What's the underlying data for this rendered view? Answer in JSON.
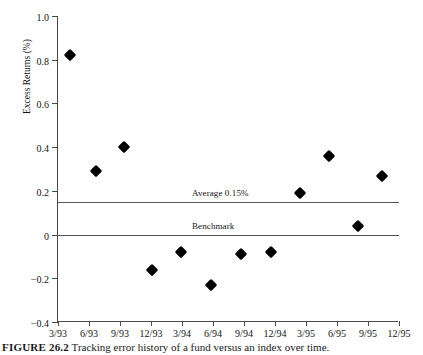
{
  "chart_data": {
    "type": "scatter",
    "title": "",
    "xlabel": "",
    "ylabel": "Excess Returns (%)",
    "ylim": [
      -0.4,
      1.0
    ],
    "yticks": [
      "1.0",
      "0.8",
      "0.6",
      "0.4",
      "0.2",
      "0",
      "-0.2",
      "-0.4"
    ],
    "ytick_values": [
      1.0,
      0.8,
      0.6,
      0.4,
      0.2,
      0,
      -0.2,
      -0.4
    ],
    "categories": [
      "3/93",
      "6/93",
      "9/93",
      "12/93",
      "3/94",
      "6/94",
      "9/94",
      "12/94",
      "3/95",
      "6/95",
      "9/95",
      "12/95"
    ],
    "grid": false,
    "legend": "none",
    "marker": "diamond",
    "marker_color": "#000000",
    "series": [
      {
        "name": "Excess Returns",
        "values": [
          0.82,
          0.29,
          0.4,
          -0.16,
          -0.08,
          -0.23,
          -0.09,
          -0.08,
          0.19,
          0.36,
          0.04,
          0.27
        ]
      }
    ],
    "reference_lines": [
      {
        "label": "Average 0.15%",
        "value": 0.15,
        "color": "#555555"
      },
      {
        "label": "Benchmark",
        "value": 0.0,
        "color": "#555555"
      }
    ]
  },
  "caption": {
    "figure_number": "FIGURE 26.2",
    "text": "Tracking error history of a fund versus an index over time."
  }
}
